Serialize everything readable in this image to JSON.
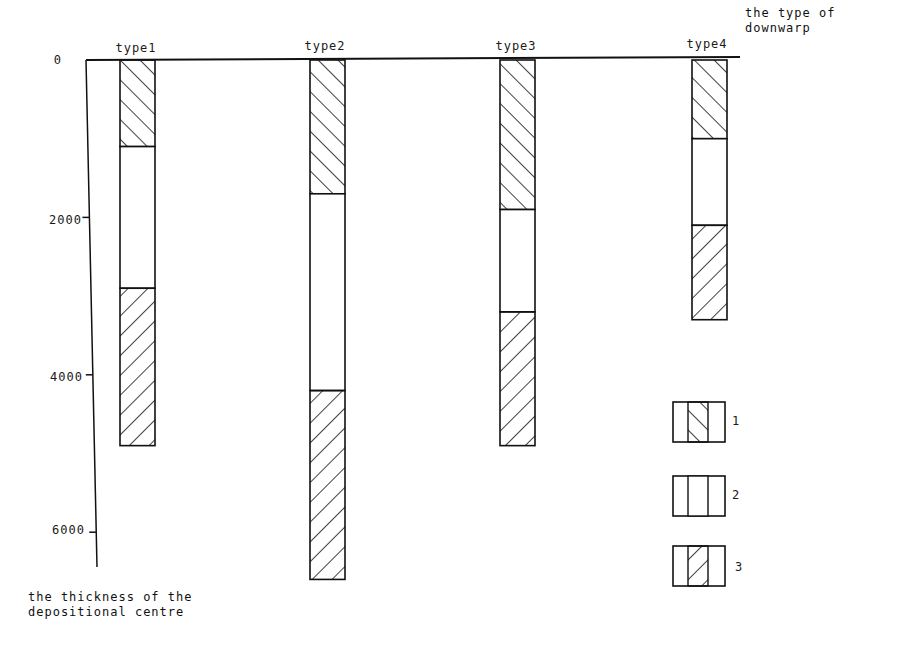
{
  "chart_data": {
    "type": "bar",
    "subtype": "stacked-column-inverted",
    "title": "",
    "xlabel": "the type of downwarp",
    "ylabel": "the thickness of the depositional centre",
    "categories": [
      "type1",
      "type2",
      "type3",
      "type4"
    ],
    "y_ticks": [
      0,
      2000,
      4000,
      6000
    ],
    "ylim": [
      0,
      6600
    ],
    "y_inverted": true,
    "grid": false,
    "legend_position": "lower-right",
    "legend": [
      {
        "id": "1",
        "label": "1",
        "pattern": "hatch-backslash"
      },
      {
        "id": "2",
        "label": "2",
        "pattern": "blank"
      },
      {
        "id": "3",
        "label": "3",
        "pattern": "hatch-slash"
      }
    ],
    "series": [
      {
        "name": "1",
        "pattern": "hatch-backslash",
        "from": [
          0,
          0,
          0,
          0
        ],
        "to": [
          1100,
          1700,
          1900,
          1000
        ]
      },
      {
        "name": "2",
        "pattern": "blank",
        "from": [
          1100,
          1700,
          1900,
          1000
        ],
        "to": [
          2900,
          4200,
          3200,
          2100
        ]
      },
      {
        "name": "3",
        "pattern": "hatch-slash",
        "from": [
          2900,
          4200,
          3200,
          2100
        ],
        "to": [
          4900,
          6600,
          4900,
          3300
        ]
      }
    ]
  },
  "labels": {
    "x_title_line1": "the type of",
    "x_title_line2": "downwarp",
    "y_title_line1": "the thickness of the",
    "y_title_line2": "depositional centre",
    "tick_0": "0",
    "tick_2000": "2000",
    "tick_4000": "4000",
    "tick_6000": "6000",
    "cat_1": "type1",
    "cat_2": "type2",
    "cat_3": "type3",
    "cat_4": "type4",
    "legend_1": "1",
    "legend_2": "2",
    "legend_3": "3"
  }
}
